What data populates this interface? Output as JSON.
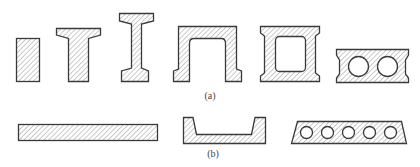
{
  "figure": {
    "part_a": {
      "label": "(a)",
      "shapes": [
        {
          "name": "rectangular-section"
        },
        {
          "name": "t-section"
        },
        {
          "name": "i-section"
        },
        {
          "name": "inverted-channel-section"
        },
        {
          "name": "box-section"
        },
        {
          "name": "hollow-core-section-2-voids"
        }
      ]
    },
    "part_b": {
      "label": "(b)",
      "shapes": [
        {
          "name": "flat-slab-section"
        },
        {
          "name": "trough-slab-section"
        },
        {
          "name": "hollow-core-slab-5-voids"
        }
      ]
    },
    "colors": {
      "outline": "#3a3a3a",
      "hatch": "#8a8a8a",
      "background": "#ffffff"
    }
  }
}
